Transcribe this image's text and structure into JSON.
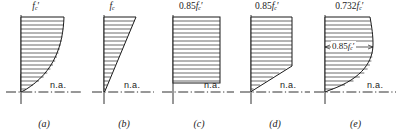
{
  "figure": {
    "neutral_axis_label": "n.a.",
    "stroke_color": "#1a1a1a",
    "background_color": "#ffffff"
  },
  "panels": [
    {
      "caption": "(a)",
      "top_label": "f_c'",
      "top_label_base": "f",
      "top_label_sub": "c",
      "top_label_prime": "′",
      "top_label_coeff": "",
      "na_label": "n.a.",
      "shape": "parabolic-curved-block",
      "mid_label": null
    },
    {
      "caption": "(b)",
      "top_label": "f_c",
      "top_label_base": "f",
      "top_label_sub": "c",
      "top_label_prime": "",
      "top_label_coeff": "",
      "na_label": "n.a.",
      "shape": "linear-triangular-block",
      "mid_label": null
    },
    {
      "caption": "(c)",
      "top_label": "0.85f_c'",
      "top_label_base": "f",
      "top_label_sub": "c",
      "top_label_prime": "′",
      "top_label_coeff": "0.85",
      "na_label": "n.a.",
      "shape": "rectangular-block",
      "mid_label": null
    },
    {
      "caption": "(d)",
      "top_label": "0.85f_c'",
      "top_label_base": "f",
      "top_label_sub": "c",
      "top_label_prime": "′",
      "top_label_coeff": "0.85",
      "na_label": "n.a.",
      "shape": "trapezoidal-block",
      "mid_label": null
    },
    {
      "caption": "(e)",
      "top_label": "0.732f_c'",
      "top_label_base": "f",
      "top_label_sub": "c",
      "top_label_prime": "′",
      "top_label_coeff": "0.732",
      "na_label": "n.a.",
      "shape": "curved-bulged-block",
      "mid_label": "0.85f_c'",
      "mid_label_base": "f",
      "mid_label_sub": "c",
      "mid_label_prime": "′",
      "mid_label_coeff": "0.85"
    }
  ]
}
